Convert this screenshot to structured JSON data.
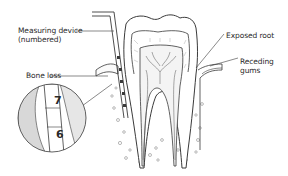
{
  "diagram": {
    "labels": {
      "measuring_device_line1": "Measuring device",
      "measuring_device_line2": "(numbered)",
      "bone_loss": "Bone loss",
      "exposed_root": "Exposed root",
      "receding_gums_line1": "Receding",
      "receding_gums_line2": "gums"
    },
    "inset": {
      "marks": [
        "7",
        "6"
      ]
    },
    "colors": {
      "line": "#3a3a3a",
      "background": "#ffffff",
      "shade": "#cfcfcf",
      "text": "#2a2a2a"
    }
  }
}
